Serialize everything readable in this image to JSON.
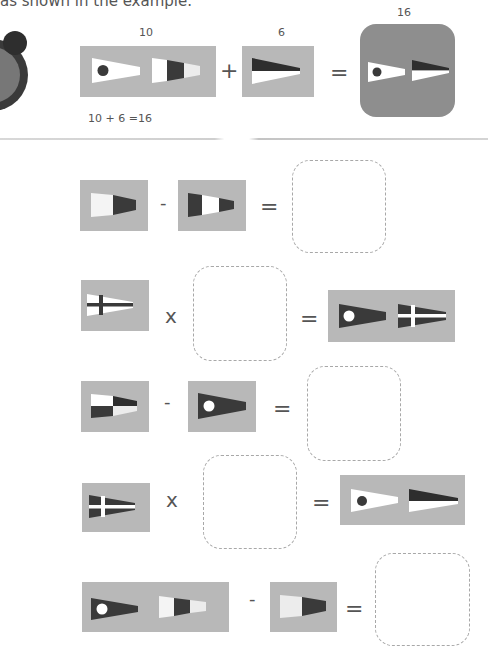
{
  "instruction": "as shown in the example.",
  "colors": {
    "panel": "#b8b8b8",
    "result_panel": "#8e8e8e",
    "flag_dark": "#3a3a3a",
    "flag_white": "#ffffff",
    "flag_light": "#e8e8e8",
    "dashed_border": "#a8a8a8"
  },
  "example": {
    "term1_value": "10",
    "term1_flags": [
      "pennant-1-dot",
      "pennant-0-stripes"
    ],
    "operator1": "+",
    "term2_value": "6",
    "term2_flags": [
      "pennant-6-dark-over-white"
    ],
    "operator2": "=",
    "result_value": "16",
    "result_flags": [
      "pennant-1-dot",
      "pennant-6-dark-over-white"
    ],
    "caption": "10 + 6 =16"
  },
  "problems": [
    {
      "left_flags": [
        "pennant-8"
      ],
      "operator": "-",
      "right_flags": [
        "pennant-7"
      ],
      "equals": "=",
      "answer": ""
    },
    {
      "left_flags": [
        "pennant-4-cross"
      ],
      "operator": "x",
      "right_flags": [],
      "equals": "=",
      "result_flags": [
        "pennant-1-inverse",
        "pennant-4-cross-inverse"
      ],
      "answer": ""
    },
    {
      "left_flags": [
        "pennant-5-checker"
      ],
      "operator": "-",
      "right_flags": [
        "pennant-1-inverse"
      ],
      "equals": "=",
      "answer": ""
    },
    {
      "left_flags": [
        "pennant-4-cross-inverse"
      ],
      "operator": "x",
      "right_flags": [],
      "equals": "=",
      "result_flags": [
        "pennant-1-dot",
        "pennant-6-dark-over-white"
      ],
      "answer": ""
    },
    {
      "left_flags": [
        "pennant-1-inverse",
        "pennant-0-stripes"
      ],
      "operator": "-",
      "right_flags": [
        "pennant-8"
      ],
      "equals": "=",
      "answer": ""
    }
  ]
}
